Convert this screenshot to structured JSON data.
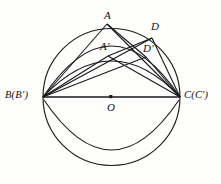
{
  "figure": {
    "kind": "geometry-diagram",
    "title": "",
    "stroke_color": "#1a1a1a",
    "background_color": "#fefefd",
    "labels": {
      "A": "A",
      "A_prime": "A′",
      "D": "D",
      "D_prime": "D′",
      "B": "B(B′)",
      "C": "C(C′)",
      "O": "O"
    },
    "points": {
      "A": {
        "x": 107,
        "y": 24
      },
      "A_prime": {
        "x": 108,
        "y": 56
      },
      "D": {
        "x": 152,
        "y": 38
      },
      "D_prime": {
        "x": 146,
        "y": 57
      },
      "B": {
        "x": 43,
        "y": 97
      },
      "C": {
        "x": 180,
        "y": 97
      },
      "O": {
        "x": 111,
        "y": 97
      }
    },
    "circle": {
      "cx": 111.5,
      "cy": 97,
      "r": 68.5
    },
    "inner_arc": {
      "description": "lower chord arc from B to C bulging downward",
      "sagitta": 50
    },
    "upper_arc": {
      "description": "arc from B through A-region to C",
      "sagitta": 45
    },
    "segments": [
      "B-A",
      "A-C",
      "B-A'",
      "A'-C",
      "B-D",
      "D-C",
      "B-D'",
      "D'-C",
      "B-C",
      "A-D'",
      "A'-D"
    ]
  }
}
